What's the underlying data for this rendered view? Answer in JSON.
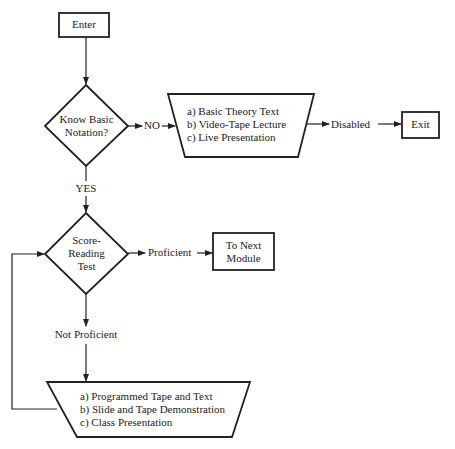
{
  "flowchart": {
    "nodes": {
      "enter": {
        "label": "Enter"
      },
      "decision1": {
        "line1": "Know Basic",
        "line2": "Notation?"
      },
      "options1": {
        "items": [
          "a)  Basic Theory Text",
          "b)  Video-Tape Lecture",
          "c)  Live Presentation"
        ]
      },
      "exit": {
        "label": "Exit"
      },
      "decision2": {
        "line1": "Score-",
        "line2": "Reading",
        "line3": "Test"
      },
      "next_module": {
        "line1": "To Next",
        "line2": "Module"
      },
      "options2": {
        "items": [
          "a)  Programmed Tape and Text",
          "b)  Slide and Tape Demonstration",
          "c)  Class Presentation"
        ]
      }
    },
    "edges": {
      "no": "NO",
      "yes": "YES",
      "disabled": "Disabled",
      "proficient": "Proficient",
      "not_proficient": "Not Proficient"
    },
    "colors": {
      "stroke": "#222222",
      "background": "#ffffff"
    }
  }
}
